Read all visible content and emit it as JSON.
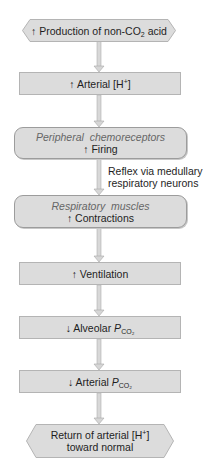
{
  "diagram": {
    "type": "flowchart",
    "colors": {
      "box_fill": "#dcdcdc",
      "box_border": "#b4b4b4",
      "arrow": "#c8c8c8",
      "italic_text": "#666666",
      "text": "#1e1e1e"
    },
    "nodes": [
      {
        "id": "n1",
        "shape": "hexagon",
        "arrow_symbol": "↑",
        "text": "Production of non-CO",
        "sub": "2",
        "text_after": " acid"
      },
      {
        "id": "n2",
        "shape": "rect",
        "arrow_symbol": "↑",
        "text": "Arterial [H",
        "sup": "+",
        "text_after": "]"
      },
      {
        "id": "n3",
        "shape": "rounded",
        "title": "Peripheral  chemoreceptors",
        "arrow_symbol": "↑",
        "text": "Firing"
      },
      {
        "id": "n4",
        "shape": "rounded",
        "title": "Respiratory  muscles",
        "arrow_symbol": "↑",
        "text": "Contractions"
      },
      {
        "id": "n5",
        "shape": "rect",
        "arrow_symbol": "↑",
        "text": "Ventilation"
      },
      {
        "id": "n6",
        "shape": "rect",
        "arrow_symbol": "↓",
        "text": "Alveolar ",
        "var": "P",
        "sub": "CO₂"
      },
      {
        "id": "n7",
        "shape": "rect",
        "arrow_symbol": "↓",
        "text": "Arterial ",
        "var": "P",
        "sub": "CO₂"
      },
      {
        "id": "n8",
        "shape": "hexagon",
        "line1": "Return of arterial [H",
        "sup": "+",
        "line1_after": "]",
        "line2": "toward normal"
      }
    ],
    "edge_label": {
      "from": "n3",
      "to": "n4",
      "line1": "Reflex via medullary",
      "line2": "respiratory neurons"
    }
  }
}
